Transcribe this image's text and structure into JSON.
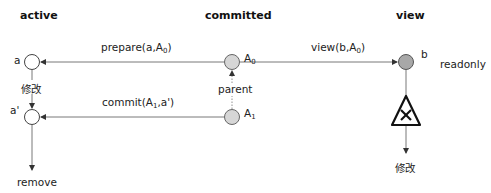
{
  "columns": {
    "active": "active",
    "committed": "committed",
    "view": "view"
  },
  "nodes": {
    "a": {
      "label": "a",
      "fill": "#ffffff"
    },
    "a_prime": {
      "label": "a'",
      "fill": "#ffffff"
    },
    "A0": {
      "label_main": "A",
      "label_sub": "0",
      "fill": "#d6d6d6"
    },
    "A1": {
      "label_main": "A",
      "label_sub": "1",
      "fill": "#d6d6d6"
    },
    "b": {
      "label": "b",
      "fill": "#a8a8a8",
      "note": "readonly"
    }
  },
  "edges": {
    "prepare": {
      "text_main": "prepare(a,A",
      "text_sub": "0",
      "text_end": ")"
    },
    "view": {
      "text_main": "view(b,A",
      "text_sub": "0",
      "text_end": ")"
    },
    "commit": {
      "text_main": "commit(A",
      "text_sub": "1",
      "text_end": ",a')"
    },
    "parent": {
      "text": "parent"
    },
    "modify_active": {
      "text": "修改"
    },
    "remove": {
      "text": "remove"
    },
    "modify_view": {
      "text": "修改"
    }
  },
  "icons": {
    "forbidden": "warning-triangle-with-x"
  }
}
